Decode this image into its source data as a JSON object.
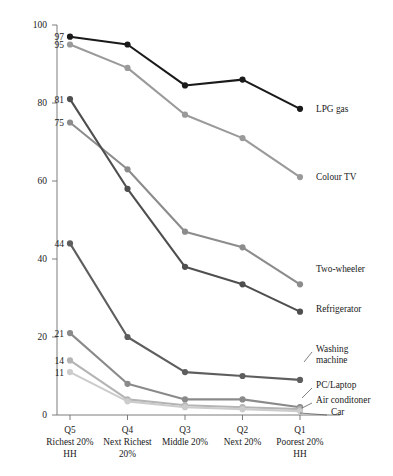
{
  "chart_data": {
    "type": "line",
    "title": "",
    "xlabel": "",
    "ylabel": "",
    "ylim": [
      0,
      100
    ],
    "yticks": [
      0,
      20,
      40,
      60,
      80,
      100
    ],
    "grid": false,
    "legend_position": "right-inline",
    "categories": [
      "Q5",
      "Q4",
      "Q3",
      "Q2",
      "Q1"
    ],
    "category_sublabels": [
      [
        "Richest 20%",
        "HH"
      ],
      [
        "Next Richest",
        "20%"
      ],
      [
        "Middle 20%",
        ""
      ],
      [
        "Next 20%",
        ""
      ],
      [
        "Poorest 20%",
        "HH"
      ]
    ],
    "series": [
      {
        "name": "LPG gas",
        "color": "#1a1a1a",
        "values": [
          97,
          95,
          84.5,
          86,
          78.5
        ],
        "start_label": "97"
      },
      {
        "name": "Colour TV",
        "color": "#9a9a9a",
        "values": [
          95,
          89,
          77,
          71,
          61
        ],
        "start_label": "95"
      },
      {
        "name": "Two-wheeler",
        "color": "#8c8c8c",
        "values": [
          75,
          63,
          47,
          43,
          33.5
        ],
        "start_label": "75"
      },
      {
        "name": "Refrigerator",
        "color": "#4f4f4f",
        "values": [
          81,
          58,
          38,
          33.5,
          26.5
        ],
        "start_label": "81"
      },
      {
        "name": "Washing machine",
        "color": "#5e5e5e",
        "values": [
          44,
          20,
          11,
          10,
          9
        ],
        "start_label": "44"
      },
      {
        "name": "PC/Laptop",
        "color": "#8a8a8a",
        "values": [
          21,
          8,
          4,
          4,
          2
        ],
        "start_label": "21"
      },
      {
        "name": "Air conditoner",
        "color": "#b4b4b4",
        "values": [
          14,
          4,
          2.5,
          2,
          1.5
        ],
        "start_label": "14"
      },
      {
        "name": "Car",
        "color": "#cccccc",
        "values": [
          11,
          3.5,
          2,
          1.5,
          1
        ],
        "start_label": "11"
      }
    ]
  }
}
